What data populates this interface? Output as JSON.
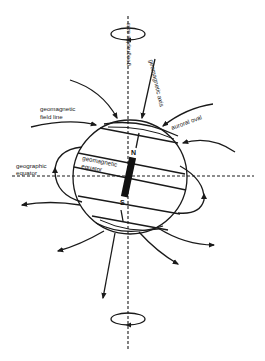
{
  "diagram": {
    "type": "earth-magnetic-field",
    "labels": {
      "geographic_axis": "geographic axis",
      "geomagnetic_axis": "geomagnetic axis",
      "field_line_1": "geomagnetic",
      "field_line_2": "field line",
      "auroral_oval": "auroral oval",
      "geographic_equator_1": "geographic",
      "geographic_equator_2": "equator",
      "geomagnetic_equator_1": "geomagnetic",
      "geomagnetic_equator_2": "equator",
      "north_pole": "N",
      "south_pole": "S"
    },
    "colors": {
      "line": "#1a1a1a",
      "background": "#ffffff",
      "magnet": "#111111"
    },
    "icons": {
      "rotation_top": "rotation-ellipse-icon",
      "rotation_bottom": "rotation-ellipse-icon",
      "bar_magnet": "bar-magnet-icon"
    }
  }
}
